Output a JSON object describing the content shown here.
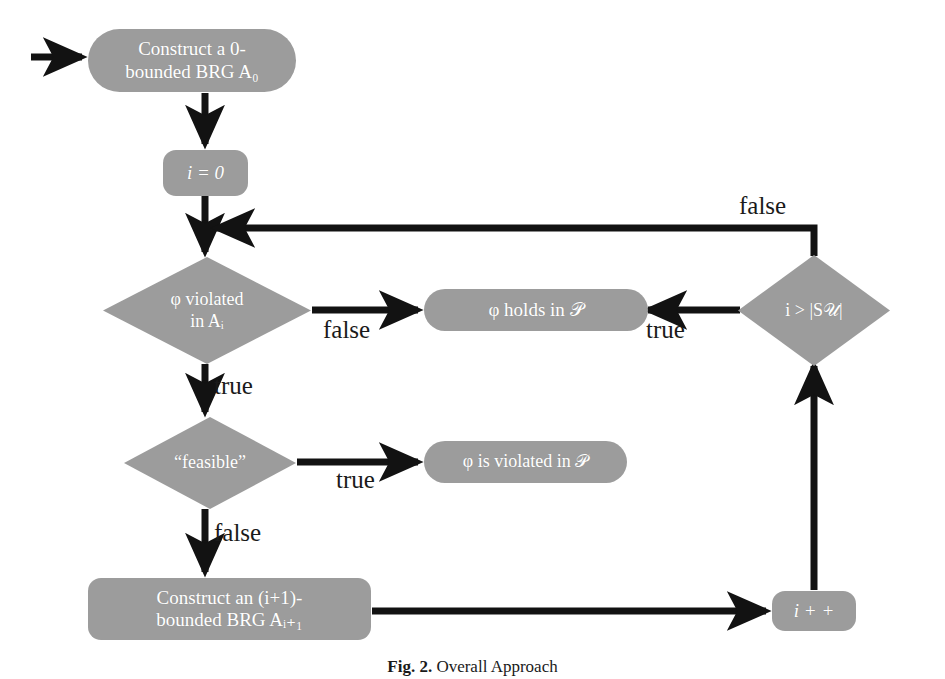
{
  "figure": {
    "caption_number": "Fig. 2.",
    "caption_text": "Overall Approach",
    "background_color": "#ffffff",
    "node_fill_color": "#9c9c9c",
    "node_text_color": "#ffffff",
    "edge_color": "#121212",
    "label_color": "#1a1a1a"
  },
  "nodes": {
    "construct_a0": {
      "id": "construct-a0",
      "shape": "pill",
      "text": "Construct a 0-\nbounded BRG A₀"
    },
    "init_i": {
      "id": "init-i",
      "shape": "rounded",
      "text": "i = 0"
    },
    "phi_violated": {
      "id": "phi-violated-in-ai",
      "shape": "diamond",
      "text": "φ violated\nin Aᵢ"
    },
    "phi_holds": {
      "id": "phi-holds-in-p",
      "shape": "pill",
      "text": "φ holds in 𝒫"
    },
    "i_greater_su": {
      "id": "i-greater-than-su",
      "shape": "diamond",
      "text": "i > |S𝒰|"
    },
    "feasible": {
      "id": "feasible",
      "shape": "diamond",
      "text": "“feasible”"
    },
    "phi_is_violated": {
      "id": "phi-is-violated-in-p",
      "shape": "pill",
      "text": "φ is violated in 𝒫"
    },
    "construct_ai1": {
      "id": "construct-ai-plus-1",
      "shape": "rounded",
      "text": "Construct an (i+1)-\nbounded BRG Aᵢ₊₁"
    },
    "increment_i": {
      "id": "increment-i",
      "shape": "rounded",
      "text": "i + +"
    }
  },
  "edge_labels": {
    "violated_false": "false",
    "violated_true": "true",
    "su_true": "true",
    "su_false": "false",
    "feasible_true": "true",
    "feasible_false": "false"
  }
}
